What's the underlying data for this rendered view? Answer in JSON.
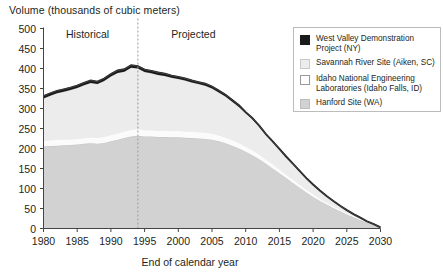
{
  "chart": {
    "type": "area",
    "title_y": "Volume (thousands of cubic meters)",
    "title_x": "End of calendar year"
  },
  "annotations": {
    "historical": "Historical",
    "projected": "Projected",
    "divider_year": 1994
  },
  "legend": {
    "items": [
      {
        "label": "West Valley Demonstration Project (NY)",
        "color": "#1a1a1a",
        "border": "#1a1a1a"
      },
      {
        "label": "Savannah River Site (Aiken, SC)",
        "color": "#ececec",
        "border": "#c9c9c9"
      },
      {
        "label": "Idaho National Engineering Laboratories (Idaho Falls, ID)",
        "color": "#ffffff",
        "border": "#9a9a9a"
      },
      {
        "label": "Hanford Site (WA)",
        "color": "#d2d2d2",
        "border": "#bdbdbd"
      }
    ]
  },
  "chart_data": {
    "type": "area",
    "stacked": true,
    "title": "Volume (thousands of cubic meters)",
    "xlabel": "End of calendar year",
    "ylabel": "Volume (thousands of cubic meters)",
    "xlim": [
      1980,
      2030
    ],
    "ylim": [
      0,
      500
    ],
    "ytick_labels": [
      "0",
      "50",
      "100",
      "150",
      "200",
      "250",
      "300",
      "350",
      "400",
      "450",
      "500"
    ],
    "yticks": [
      0,
      50,
      100,
      150,
      200,
      250,
      300,
      350,
      400,
      450,
      500
    ],
    "xtick_labels": [
      "1980",
      "1985",
      "1990",
      "1995",
      "2000",
      "2005",
      "2010",
      "2015",
      "2020",
      "2025",
      "2030"
    ],
    "xticks": [
      1980,
      1985,
      1990,
      1995,
      2000,
      2005,
      2010,
      2015,
      2020,
      2025,
      2030
    ],
    "grid": false,
    "legend_position": "top-right",
    "x": [
      1980,
      1981,
      1982,
      1983,
      1984,
      1985,
      1986,
      1987,
      1988,
      1989,
      1990,
      1991,
      1992,
      1993,
      1994,
      1995,
      1996,
      1997,
      1998,
      1999,
      2000,
      2001,
      2002,
      2003,
      2004,
      2005,
      2006,
      2007,
      2008,
      2009,
      2010,
      2011,
      2012,
      2013,
      2014,
      2015,
      2016,
      2017,
      2018,
      2019,
      2020,
      2021,
      2022,
      2023,
      2024,
      2025,
      2026,
      2027,
      2028,
      2029,
      2030
    ],
    "series": [
      {
        "name": "Hanford Site (WA)",
        "values": [
          205,
          206,
          207,
          208,
          209,
          210,
          212,
          213,
          212,
          214,
          218,
          222,
          226,
          230,
          232,
          230,
          230,
          229,
          229,
          228,
          228,
          227,
          226,
          225,
          224,
          222,
          218,
          213,
          207,
          200,
          192,
          183,
          173,
          162,
          150,
          138,
          126,
          114,
          102,
          90,
          79,
          69,
          60,
          51,
          43,
          35,
          28,
          21,
          15,
          9,
          3
        ]
      },
      {
        "name": "Idaho National Engineering Laboratories (Idaho Falls, ID)",
        "values": [
          14,
          14,
          14,
          14,
          13,
          13,
          13,
          14,
          14,
          14,
          15,
          15,
          16,
          16,
          16,
          15,
          15,
          15,
          15,
          15,
          15,
          15,
          15,
          15,
          15,
          15,
          14,
          14,
          13,
          13,
          12,
          12,
          11,
          10,
          10,
          9,
          8,
          8,
          7,
          6,
          6,
          5,
          4,
          4,
          3,
          3,
          2,
          2,
          1,
          1,
          0
        ]
      },
      {
        "name": "Savannah River Site (Aiken, SC)",
        "values": [
          106,
          112,
          117,
          120,
          124,
          128,
          133,
          137,
          135,
          141,
          147,
          152,
          150,
          156,
          152,
          146,
          143,
          140,
          137,
          134,
          131,
          128,
          124,
          121,
          118,
          113,
          108,
          103,
          97,
          91,
          84,
          78,
          71,
          64,
          58,
          52,
          46,
          40,
          35,
          30,
          25,
          21,
          17,
          14,
          11,
          8,
          6,
          4,
          2,
          1,
          0
        ]
      },
      {
        "name": "West Valley Demonstration Project (NY)",
        "values": [
          6,
          6,
          6,
          6,
          6,
          6,
          6,
          6,
          6,
          6,
          6,
          6,
          6,
          6,
          6,
          6,
          6,
          6,
          6,
          5,
          5,
          5,
          5,
          5,
          5,
          5,
          5,
          4,
          4,
          4,
          3,
          3,
          2,
          0,
          0,
          0,
          0,
          0,
          0,
          0,
          0,
          0,
          0,
          0,
          0,
          0,
          0,
          0,
          0,
          0,
          0
        ]
      }
    ],
    "totals": [
      331,
      338,
      344,
      348,
      352,
      357,
      364,
      370,
      367,
      375,
      386,
      395,
      398,
      408,
      406,
      397,
      394,
      390,
      387,
      382,
      379,
      375,
      370,
      366,
      362,
      355,
      345,
      334,
      321,
      308,
      291,
      276,
      257,
      236,
      218,
      199,
      180,
      162,
      144,
      126,
      110,
      95,
      81,
      69,
      57,
      46,
      36,
      27,
      18,
      11,
      3
    ]
  }
}
